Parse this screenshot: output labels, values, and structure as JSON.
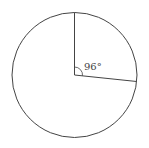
{
  "diagram": {
    "type": "circle-sector",
    "angle_label": "96°",
    "angle_degrees": 96,
    "stroke_color": "#444444",
    "background": "#ffffff"
  }
}
